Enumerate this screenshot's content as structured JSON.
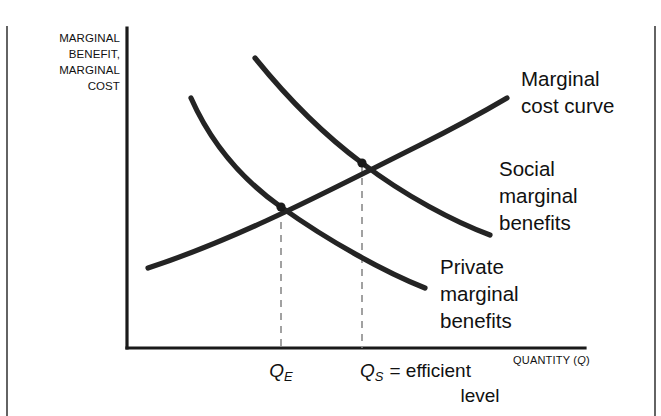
{
  "figure": {
    "type": "economics-diagram"
  },
  "axes": {
    "y_label_lines": [
      "MARGINAL",
      "BENEFIT,",
      "MARGINAL",
      "COST"
    ],
    "x_label": "QUANTITY (",
    "x_label_var": "Q",
    "x_label_end": ")"
  },
  "curves": [
    {
      "id": "marginal-cost",
      "label_lines": [
        "Marginal",
        "cost curve"
      ],
      "color": "#242424",
      "shape": "upward-sloping",
      "path": "M 148,268 C 240,238 330,190 420,145 C 460,125 490,108 507,98"
    },
    {
      "id": "social-marginal-benefits",
      "label_lines": [
        "Social",
        "marginal",
        "benefits"
      ],
      "color": "#242424",
      "shape": "downward-sloping",
      "path": "M 255,58 C 285,95 320,132 362,163 C 405,196 455,222 490,235"
    },
    {
      "id": "private-marginal-benefits",
      "label_lines": [
        "Private",
        "marginal",
        "benefits"
      ],
      "color": "#242424",
      "shape": "downward-sloping-convex",
      "path": "M 191,98 C 214,150 247,183 281,207 C 330,242 385,272 425,288"
    }
  ],
  "intersections": [
    {
      "id": "private-equilibrium",
      "tick_var": "Q",
      "tick_sub": "E",
      "x": 281,
      "y": 207,
      "note": ""
    },
    {
      "id": "social-optimum",
      "tick_var": "Q",
      "tick_sub": "S",
      "x": 362,
      "y": 163,
      "note": "= efficient",
      "note_line2": "level"
    }
  ],
  "colors": {
    "curve": "#242424",
    "axis": "#1a1a1a",
    "dropline": "#8a8a8a",
    "background": "#ffffff"
  }
}
